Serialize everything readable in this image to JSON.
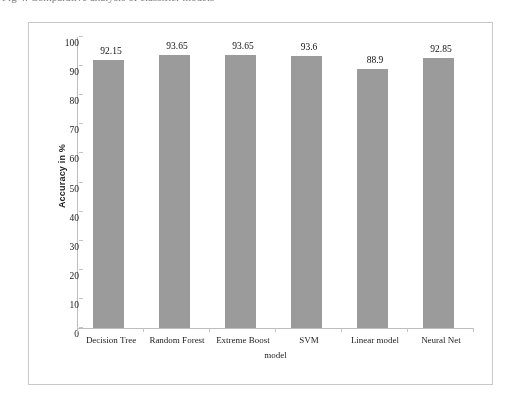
{
  "caption": {
    "text": "Fig 4. Comparative analysis of classifier models"
  },
  "chart_data": {
    "type": "bar",
    "title": "",
    "subtitle": "",
    "categories": [
      "Decision Tree",
      "Random Forest",
      "Extreme Boost",
      "SVM",
      "Linear model",
      "Neural Net"
    ],
    "values": [
      92.15,
      93.65,
      93.65,
      93.6,
      88.9,
      92.85
    ],
    "value_labels": [
      "92.15",
      "93.65",
      "93.65",
      "93.6",
      "88.9",
      "92.85"
    ],
    "xlabel": "model",
    "ylabel": "Accuracy in %",
    "ylim": [
      0,
      100
    ],
    "ytick_step": 10,
    "ytick_labels": [
      "100",
      "90",
      "80",
      "70",
      "60",
      "50",
      "40",
      "30",
      "20",
      "10",
      "0"
    ],
    "ytick_values": [
      100,
      90,
      80,
      70,
      60,
      50,
      40,
      30,
      20,
      10,
      0
    ],
    "grid": false,
    "legend": false,
    "legend_position": "none",
    "series": [
      {
        "name": "Accuracy",
        "values": [
          92.15,
          93.65,
          93.65,
          93.6,
          88.9,
          92.85
        ],
        "color": "#9b9b9b"
      }
    ],
    "colors": {
      "bar": "#9b9b9b",
      "axis": "#bdbdbd",
      "frame": "#c8c8c8",
      "background": "#ffffff",
      "text": "#1c1c1c"
    }
  }
}
